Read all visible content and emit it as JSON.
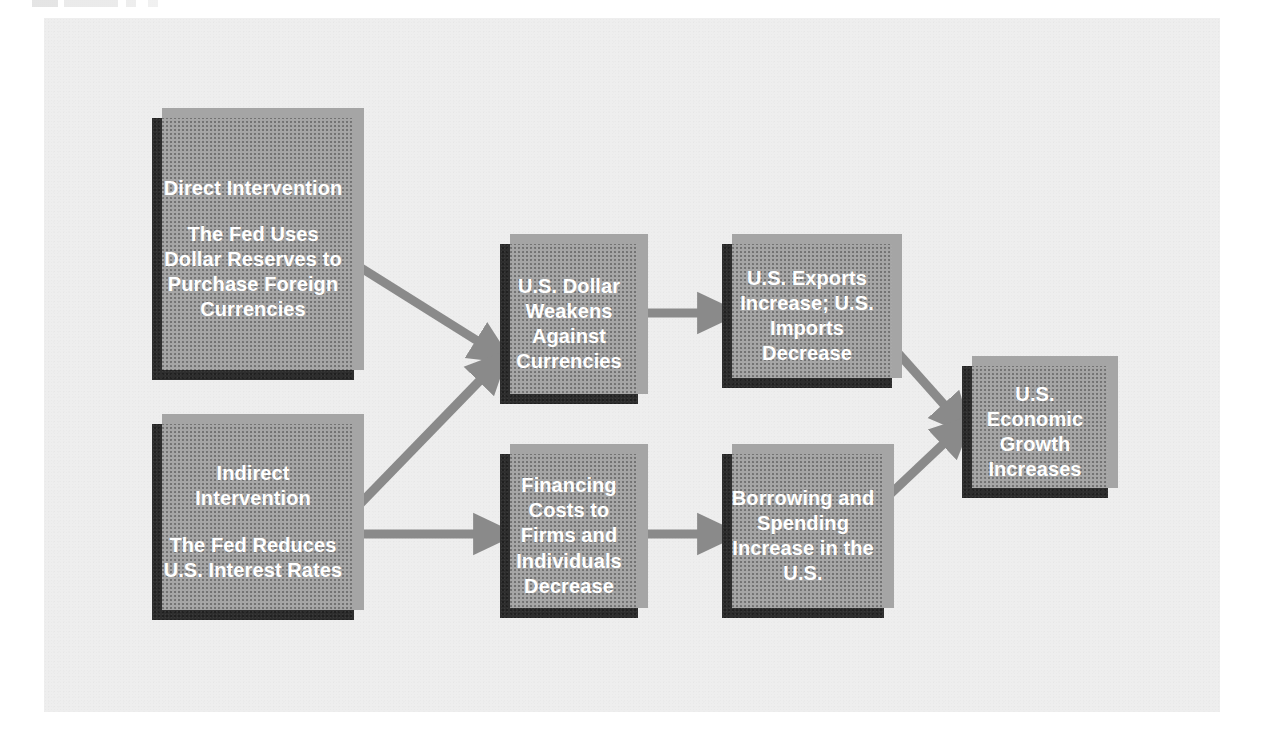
{
  "figure": {
    "panel_bg": "#eeeeee",
    "box_fill": "#2e2e2e",
    "box_shadow": "#a5a5a5",
    "arrow_color": "#8a8a8a",
    "text_color": "#ffffff",
    "topic": "Federal Reserve intervention and U.S. economic growth"
  },
  "nodes": {
    "direct": {
      "heading": "Direct Intervention",
      "body": "The Fed Uses Dollar Reserves to Purchase Foreign Currencies"
    },
    "indirect": {
      "heading": "Indirect Intervention",
      "body": "The Fed Reduces U.S. Interest Rates"
    },
    "dollar": {
      "heading": "",
      "body": "U.S. Dollar Weakens Against Currencies"
    },
    "trade": {
      "heading": "",
      "body": "U.S. Exports Increase; U.S. Imports Decrease"
    },
    "financing": {
      "heading": "",
      "body": "Financing Costs to Firms and Individuals Decrease"
    },
    "borrowing": {
      "heading": "",
      "body": "Borrowing and Spending Increase in the U.S."
    },
    "growth": {
      "heading": "",
      "body": "U.S. Economic Growth Increases"
    }
  },
  "arrows": [
    {
      "name": "direct-to-dollar",
      "from": "direct",
      "to": "dollar"
    },
    {
      "name": "indirect-to-dollar",
      "from": "indirect",
      "to": "dollar"
    },
    {
      "name": "indirect-to-financing",
      "from": "indirect",
      "to": "financing"
    },
    {
      "name": "dollar-to-trade",
      "from": "dollar",
      "to": "trade"
    },
    {
      "name": "financing-to-borrowing",
      "from": "financing",
      "to": "borrowing"
    },
    {
      "name": "trade-to-growth",
      "from": "trade",
      "to": "growth"
    },
    {
      "name": "borrowing-to-growth",
      "from": "borrowing",
      "to": "growth"
    }
  ]
}
